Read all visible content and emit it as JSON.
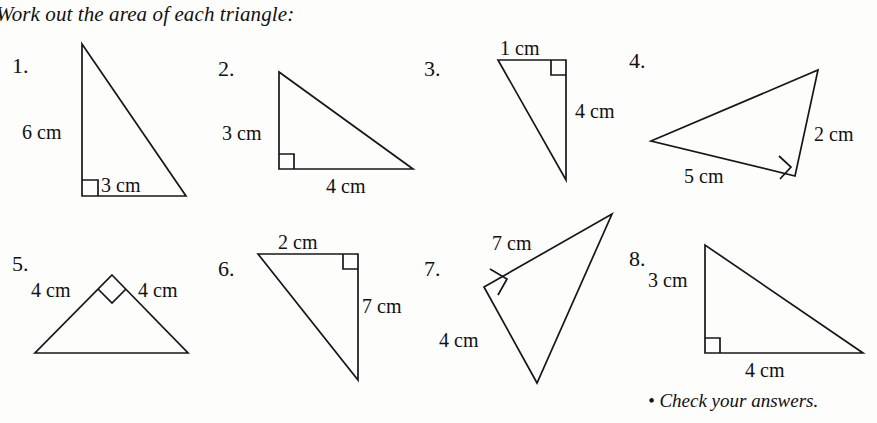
{
  "page": {
    "title": "Work out the area of each triangle:",
    "footer": "• Check your answers.",
    "ink_color": "#17171a",
    "paper_color": "#fdfdfb"
  },
  "questions": [
    {
      "number": "1.",
      "number_pos": [
        12,
        55
      ],
      "points": "82,44 82,196 186,196",
      "right_angle": "82,180 98,180 98,196",
      "labels": [
        {
          "text": "6 cm",
          "pos": [
            22,
            122
          ]
        },
        {
          "text": "3 cm",
          "pos": [
            101,
            175
          ]
        }
      ]
    },
    {
      "number": "2.",
      "number_pos": [
        218,
        58
      ],
      "points": "279,72 279,169 413,169",
      "right_angle": "279,154 294,154 294,169",
      "labels": [
        {
          "text": "3 cm",
          "pos": [
            222,
            123
          ]
        },
        {
          "text": "4 cm",
          "pos": [
            326,
            176
          ]
        }
      ]
    },
    {
      "number": "3.",
      "number_pos": [
        424,
        58
      ],
      "points": "498,60 566,60 566,180",
      "right_angle": "551,60 551,75 566,75",
      "labels": [
        {
          "text": "1 cm",
          "pos": [
            500,
            38
          ]
        },
        {
          "text": "4 cm",
          "pos": [
            575,
            101
          ]
        }
      ]
    },
    {
      "number": "4.",
      "number_pos": [
        629,
        50
      ],
      "points": "651,141 818,70 795,176",
      "right_angle": "779,156 791,167 780,179",
      "labels": [
        {
          "text": "2 cm",
          "pos": [
            814,
            124
          ]
        },
        {
          "text": "5 cm",
          "pos": [
            684,
            166
          ]
        }
      ]
    },
    {
      "number": "5.",
      "number_pos": [
        12,
        253
      ],
      "points": "112,275 188,353 35,353",
      "right_angle": "98,289 112,303 126,289",
      "labels": [
        {
          "text": "4 cm",
          "pos": [
            31,
            280
          ]
        },
        {
          "text": "4 cm",
          "pos": [
            138,
            280
          ]
        }
      ]
    },
    {
      "number": "6.",
      "number_pos": [
        218,
        258
      ],
      "points": "258,254 358,254 358,380",
      "right_angle": "343,254 343,269 358,269",
      "labels": [
        {
          "text": "2 cm",
          "pos": [
            278,
            232
          ]
        },
        {
          "text": "7 cm",
          "pos": [
            362,
            296
          ]
        }
      ]
    },
    {
      "number": "7.",
      "number_pos": [
        424,
        258
      ],
      "points": "484,287 612,214 537,383",
      "right_angle": "490,269 507,279 498,295",
      "labels": [
        {
          "text": "7 cm",
          "pos": [
            492,
            233
          ]
        },
        {
          "text": "4 cm",
          "pos": [
            439,
            330
          ]
        }
      ]
    },
    {
      "number": "8.",
      "number_pos": [
        629,
        248
      ],
      "points": "705,245 705,353 863,353",
      "right_angle": "705,338 720,338 720,353",
      "labels": [
        {
          "text": "3 cm",
          "pos": [
            648,
            270
          ]
        },
        {
          "text": "4 cm",
          "pos": [
            745,
            360
          ]
        }
      ]
    }
  ]
}
